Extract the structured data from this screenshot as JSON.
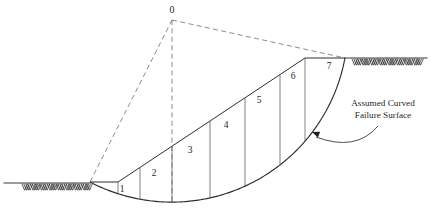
{
  "figure": {
    "background_color": "#ffffff",
    "line_color": "#2e2e2e",
    "dashed_color": "#777777",
    "hatch_color": "#3d3d3d",
    "width": 431,
    "height": 212
  },
  "center_of_rotation": {
    "label": "0",
    "x": 172,
    "y": 20,
    "label_x": 172,
    "label_y": 13
  },
  "annotation": {
    "line1": "Assumed Curved",
    "line2": "Failure Surface",
    "text_x": 383,
    "line1_y": 106,
    "line2_y": 118,
    "arrow_tip_x": 312,
    "arrow_tip_y": 132
  },
  "ground": {
    "left": {
      "y": 183,
      "x_start": 4,
      "x_end": 90,
      "hatch_x_start": 22,
      "hatch_x_end": 90,
      "hatch_count": 8
    },
    "right": {
      "y": 58,
      "x_start": 345,
      "x_end": 427,
      "hatch_x_start": 352,
      "hatch_x_end": 421,
      "hatch_count": 8
    }
  },
  "slope": {
    "toe_x": 90,
    "toe_y": 182,
    "crest_x": 305,
    "crest_y": 58,
    "bench_x": 118,
    "bench_y": 182
  },
  "failure_surface": {
    "start_x": 90,
    "start_y": 182,
    "end_x": 345,
    "end_y": 58,
    "lowest_x": 178,
    "lowest_y": 202,
    "type": "circular-arc"
  },
  "radius_lines": [
    {
      "name": "left-radius",
      "to_x": 90,
      "to_y": 182
    },
    {
      "name": "right-radius",
      "to_x": 345,
      "to_y": 58
    },
    {
      "name": "vertical-centerline",
      "to_x": 172,
      "to_y": 202
    }
  ],
  "slices": [
    {
      "label": "1",
      "label_x": 122,
      "label_y": 192,
      "divider_x": 118,
      "top_y": 182,
      "bottom_y": 196
    },
    {
      "label": "2",
      "label_x": 154,
      "label_y": 176,
      "divider_x": 140,
      "top_y": 168,
      "bottom_y": 199
    },
    {
      "label": "3",
      "label_x": 190,
      "label_y": 153,
      "divider_x": 172,
      "top_y": 149,
      "bottom_y": 202
    },
    {
      "label": "4",
      "label_x": 226,
      "label_y": 128,
      "divider_x": 210,
      "top_y": 128,
      "bottom_y": 201
    },
    {
      "label": "5",
      "label_x": 259,
      "label_y": 103,
      "divider_x": 245,
      "top_y": 108,
      "bottom_y": 196
    },
    {
      "label": "6",
      "label_x": 293,
      "label_y": 79,
      "divider_x": 280,
      "top_y": 78,
      "bottom_y": 185
    },
    {
      "label": "7",
      "label_x": 329,
      "label_y": 69,
      "divider_x": 305,
      "top_y": 58,
      "bottom_y": 170
    }
  ]
}
